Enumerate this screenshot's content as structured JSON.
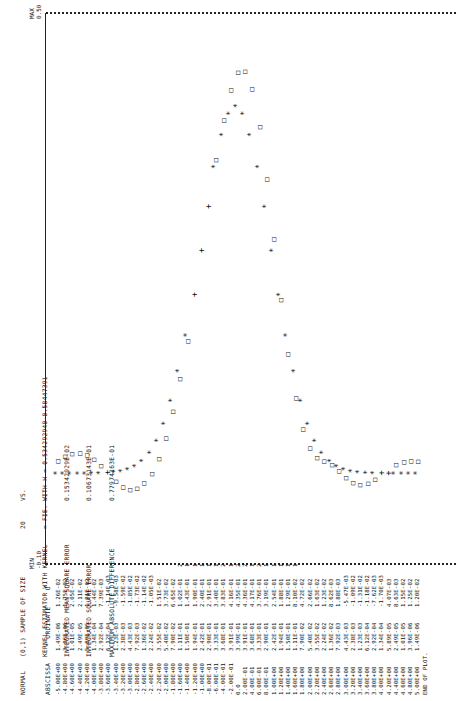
{
  "header": {
    "line1": [
      "NORMAL",
      "(0,1) SAMPLE OF SIZE",
      "20",
      "VS."
    ],
    "line2": [
      "",
      "KERNEL ESTIMATOR WITH KERNEL",
      "= FIE.",
      "WITH H = 0.534292940-0.58447391"
    ],
    "line3": [
      "",
      "INTEGRATED MEAN SQUARE ERROR",
      "",
      "0.15342929E-02"
    ],
    "line4": [
      "",
      "INTEGRATED SQUARE ERROR",
      "",
      "0.10673143E-01"
    ],
    "line5": [
      "",
      "MAXIMUM ABSOLUTE DIFFERENCE",
      "",
      "0.77974163E-01"
    ],
    "full_text": [
      "NORMAL (0,1) SAMPLE OF SIZE 20 VS.",
      "KERNEL ESTIMATOR WITH KERNEL = FIE. WITH H = 0.53429294 0.58447391",
      "INTEGRATED MEAN SQUARE ERROR 0.15342929 E-02",
      "INTEGRATED SQUARE ERROR 0.10673143 E-01",
      "MAXIMUM ABSOLUTE DIFFERENCE 0.77974163 E-01"
    ]
  },
  "columns": {
    "abscissa": "ABSCISSA",
    "ordinate_star": "* ORDINATE",
    "ordinate_o": "O"
  },
  "axis": {
    "min_label": "MIN",
    "min_value": "-0.10",
    "max_label": "MAX",
    "max_value": "0.50"
  },
  "end_text": "END OF PLOT.",
  "rows": [
    [
      "-5.00E+00",
      "1.49E-06",
      "1.26E-02",
      ""
    ],
    [
      "-4.80E+00",
      "3.96E-06",
      "1.75E-02",
      ""
    ],
    [
      "-4.60E+00",
      "1.01E-05",
      "2.05E-02",
      ""
    ],
    [
      "-4.40E+00",
      "2.49E-05",
      "2.11E-02",
      ""
    ],
    [
      "-4.20E+00",
      "5.89E-05",
      "1.91E-02",
      ""
    ],
    [
      "-4.00E+00",
      "1.34E-04",
      "1.44E-02",
      ""
    ],
    [
      "-3.80E+00",
      "2.92E-04",
      "7.39E-03",
      ""
    ],
    [
      "-3.60E+00",
      "6.12E-04",
      "-1.14E-03",
      ""
    ],
    [
      "-3.40E+00",
      "1.23E-03",
      "-9.58E-03",
      ""
    ],
    [
      "-3.20E+00",
      "2.38E-03",
      "-1.59E-02",
      ""
    ],
    [
      "-3.00E+00",
      "4.43E-03",
      "-1.85E-02",
      ""
    ],
    [
      "-2.80E+00",
      "7.92E-03",
      "-1.73E-02",
      ""
    ],
    [
      "-2.60E+00",
      "1.36E-02",
      "-1.14E-02",
      ""
    ],
    [
      "-2.40E+00",
      "2.24E-02",
      "-1.05E-03",
      ""
    ],
    [
      "-2.20E+00",
      "3.55E-02",
      "1.51E-02",
      ""
    ],
    [
      "-2.00E+00",
      "5.40E-02",
      "3.73E-02",
      ""
    ],
    [
      "-1.80E+00",
      "7.90E-02",
      "6.65E-02",
      ""
    ],
    [
      "-1.60E+00",
      "1.11E-01",
      "1.02E-01",
      "2"
    ],
    [
      "-1.40E+00",
      "1.50E-01",
      "1.43E-01",
      "1"
    ],
    [
      "-1.20E+00",
      "1.94E-01",
      "1.90E-01",
      "1"
    ],
    [
      "-1.00E+00",
      "2.42E-01",
      "2.40E-01",
      "1"
    ],
    [
      "-8.00E-01",
      "2.90E-01",
      "2.91E-01",
      "1"
    ],
    [
      "-6.00E-01",
      "3.33E-01",
      "3.40E-01",
      "1"
    ],
    [
      "-4.00E-01",
      "3.68E-01",
      "3.83E-01",
      "2"
    ],
    [
      "-2.00E-01",
      "3.91E-01",
      "4.16E-01",
      "1"
    ],
    [
      "0.0",
      "3.99E-01",
      "4.35E-01",
      "2"
    ],
    [
      "2.00E-01",
      "3.91E-01",
      "4.36E-01",
      "2"
    ],
    [
      "4.00E-01",
      "3.68E-01",
      "4.17E-01",
      "1"
    ],
    [
      "6.00E-01",
      "3.33E-01",
      "3.76E-01",
      "2"
    ],
    [
      "8.00E-01",
      "2.90E-01",
      "3.19E-01",
      "1"
    ],
    [
      "1.00E+00",
      "2.42E-01",
      "2.54E-01",
      "1"
    ],
    [
      "1.20E+00",
      "1.94E-01",
      "1.88E-01",
      "1"
    ],
    [
      "1.40E+00",
      "1.50E-01",
      "1.29E-01",
      "1"
    ],
    [
      "1.60E+00",
      "1.11E-01",
      "8.10E-02",
      "1"
    ],
    [
      "1.80E+00",
      "7.90E-02",
      "4.72E-02",
      ""
    ],
    [
      "2.00E+00",
      "5.40E-02",
      "2.66E-02",
      ""
    ],
    [
      "2.20E+00",
      "3.55E-02",
      "1.63E-02",
      ""
    ],
    [
      "2.40E+00",
      "2.24E-02",
      "1.23E-02",
      ""
    ],
    [
      "2.60E+00",
      "1.36E-02",
      "8.62E-03",
      ""
    ],
    [
      "2.80E+00",
      "7.92E-03",
      "1.88E-03",
      ""
    ],
    [
      "3.00E+00",
      "4.43E-03",
      "-5.47E-03",
      ""
    ],
    [
      "3.20E+00",
      "2.38E-03",
      "-1.09E-02",
      ""
    ],
    [
      "3.40E+00",
      "1.23E-03",
      "-1.31E-02",
      ""
    ],
    [
      "3.60E+00",
      "6.12E-04",
      "-1.18E-02",
      ""
    ],
    [
      "3.80E+00",
      "2.92E-04",
      "-7.62E-03",
      ""
    ],
    [
      "4.00E+00",
      "1.34E-04",
      "-1.70E-03",
      ""
    ],
    [
      "4.20E+00",
      "5.89E-05",
      "4.07E-03",
      ""
    ],
    [
      "4.40E+00",
      "2.49E-05",
      "8.63E-03",
      ""
    ],
    [
      "4.60E+00",
      "1.01E-05",
      "1.15E-02",
      ""
    ],
    [
      "4.80E+00",
      "3.96E-06",
      "1.25E-02",
      ""
    ],
    [
      "5.00E+00",
      "1.49E-06",
      "1.20E-02",
      ""
    ]
  ],
  "chart_data": {
    "type": "scatter",
    "xlabel": "ABSCISSA",
    "ylabel": "ORDINATE",
    "ylim": [
      -0.1,
      0.5
    ],
    "x": [
      -5.0,
      -4.8,
      -4.6,
      -4.4,
      -4.2,
      -4.0,
      -3.8,
      -3.6,
      -3.4,
      -3.2,
      -3.0,
      -2.8,
      -2.6,
      -2.4,
      -2.2,
      -2.0,
      -1.8,
      -1.6,
      -1.4,
      -1.2,
      -1.0,
      -0.8,
      -0.6,
      -0.4,
      -0.2,
      0.0,
      0.2,
      0.4,
      0.6,
      0.8,
      1.0,
      1.2,
      1.4,
      1.6,
      1.8,
      2.0,
      2.2,
      2.4,
      2.6,
      2.8,
      3.0,
      3.2,
      3.4,
      3.6,
      3.8,
      4.0,
      4.2,
      4.4,
      4.6,
      4.8,
      5.0
    ],
    "series": [
      {
        "name": "* true normal density",
        "marker": "*",
        "values": [
          1.5e-06,
          4e-06,
          1e-05,
          2.5e-05,
          5.9e-05,
          0.000134,
          0.000292,
          0.000612,
          0.00123,
          0.00238,
          0.00443,
          0.00792,
          0.0136,
          0.0224,
          0.0355,
          0.054,
          0.079,
          0.111,
          0.15,
          0.194,
          0.242,
          0.29,
          0.333,
          0.368,
          0.391,
          0.399,
          0.391,
          0.368,
          0.333,
          0.29,
          0.242,
          0.194,
          0.15,
          0.111,
          0.079,
          0.054,
          0.0355,
          0.0224,
          0.0136,
          0.00792,
          0.00443,
          0.00238,
          0.00123,
          0.000612,
          0.000292,
          0.000134,
          5.9e-05,
          2.5e-05,
          1e-05,
          4e-06,
          1.5e-06
        ]
      },
      {
        "name": "O kernel estimate",
        "marker": "O",
        "values": [
          0.0126,
          0.0175,
          0.0205,
          0.0211,
          0.0191,
          0.0144,
          0.0074,
          -0.0011,
          -0.0096,
          -0.0159,
          -0.0185,
          -0.0173,
          -0.0114,
          -0.0011,
          0.0151,
          0.0373,
          0.0665,
          0.102,
          0.143,
          0.19,
          0.24,
          0.291,
          0.34,
          0.383,
          0.416,
          0.435,
          0.436,
          0.417,
          0.376,
          0.319,
          0.254,
          0.188,
          0.129,
          0.081,
          0.0472,
          0.0266,
          0.0163,
          0.0123,
          0.0086,
          0.0019,
          -0.0055,
          -0.0109,
          -0.0131,
          -0.0118,
          -0.0076,
          -0.0017,
          0.0041,
          0.0086,
          0.0115,
          0.0125,
          0.012
        ]
      }
    ],
    "grid": false,
    "legend": "column header (* ORDINATE, O)"
  }
}
